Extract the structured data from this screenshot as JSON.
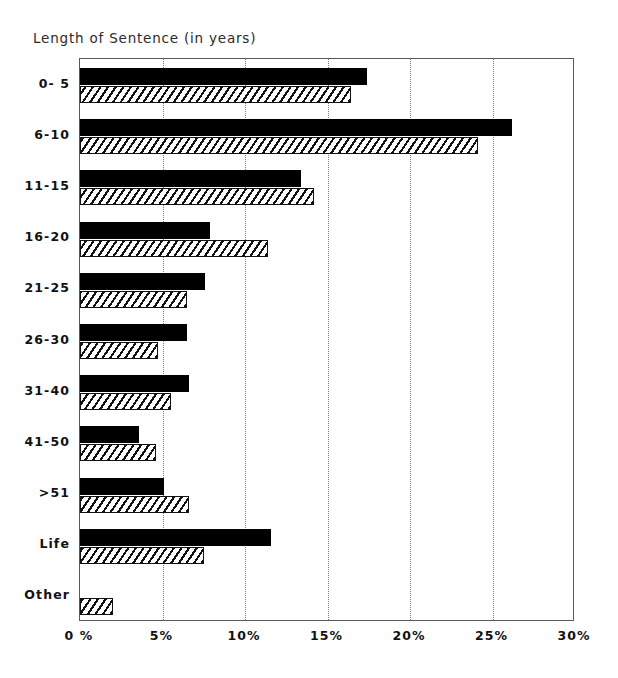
{
  "chart_data": {
    "type": "bar",
    "orientation": "horizontal",
    "title": "Length of Sentence (in years)",
    "xlabel": "",
    "ylabel": "",
    "xlim": [
      0,
      30
    ],
    "grid": true,
    "grid_axis": "x",
    "legend": "none",
    "xticks": [
      0,
      5,
      10,
      15,
      20,
      25,
      30
    ],
    "xticklabels": [
      "0 %",
      "5%",
      "10%",
      "15%",
      "20%",
      "25%",
      "30%"
    ],
    "categories": [
      "0- 5",
      "6-10",
      "11-15",
      "16-20",
      "21-25",
      "26-30",
      "31-40",
      "41-50",
      ">51",
      "Life",
      "Other"
    ],
    "series": [
      {
        "name": "series-solid",
        "style": "solid-black",
        "color": "#000000",
        "values": [
          17.4,
          26.2,
          13.4,
          7.9,
          7.6,
          6.5,
          6.6,
          3.6,
          5.1,
          11.6,
          0
        ]
      },
      {
        "name": "series-hatched",
        "style": "diagonal-hatch",
        "color": "#ffffff",
        "values": [
          16.4,
          24.1,
          14.2,
          11.4,
          6.5,
          4.7,
          5.5,
          4.6,
          6.6,
          7.5,
          2.0
        ]
      }
    ]
  }
}
